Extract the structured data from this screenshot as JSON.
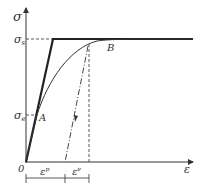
{
  "diagram": {
    "y_axis_label": "σ",
    "x_axis_label": "ε",
    "origin_label": "0",
    "yield_stress_label": "σs",
    "elastic_limit_label": "σe",
    "point_a_label": "A",
    "point_b_label": "B",
    "plastic_strain_label": "εp",
    "elastic_strain_label": "εe",
    "colors": {
      "line": "#222222",
      "axis": "#333333",
      "dashed": "#555555"
    }
  }
}
